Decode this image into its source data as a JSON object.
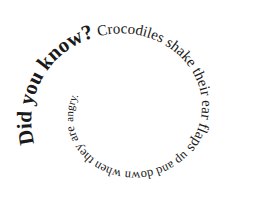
{
  "canvas": {
    "width": 255,
    "height": 219,
    "background": "#ffffff",
    "text_color": "#1a1a1a"
  },
  "spiral": {
    "center": [
      128,
      112
    ],
    "direction": "clockwise-inward",
    "segments": [
      {
        "id": "headline",
        "text": "Did you know?",
        "font_size": 21,
        "bold": true,
        "start_offset": "0"
      },
      {
        "id": "body1",
        "text": "Crocodiles shake their ear flaps",
        "font_size": 15,
        "bold": false
      },
      {
        "id": "body2",
        "text": "up and down when they are",
        "font_size": 12.5,
        "bold": false
      },
      {
        "id": "body3",
        "text": "angry.",
        "font_size": 11,
        "bold": false
      }
    ]
  },
  "full_text": "Did you know? Crocodiles shake their ear flaps up and down when they are angry."
}
